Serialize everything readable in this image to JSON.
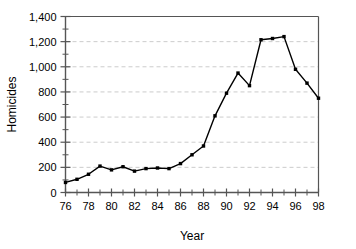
{
  "chart_data": {
    "type": "line",
    "title": "",
    "xlabel": "Year",
    "ylabel": "Homicides",
    "x": [
      76,
      77,
      78,
      79,
      80,
      81,
      82,
      83,
      84,
      85,
      86,
      87,
      88,
      89,
      90,
      91,
      92,
      93,
      94,
      95,
      96,
      97,
      98
    ],
    "values": [
      80,
      105,
      145,
      210,
      180,
      205,
      170,
      190,
      195,
      190,
      230,
      300,
      370,
      610,
      790,
      950,
      850,
      1215,
      1225,
      1240,
      980,
      870,
      750
    ],
    "x_tick_labels": [
      "76",
      "78",
      "80",
      "82",
      "84",
      "86",
      "88",
      "90",
      "92",
      "94",
      "96",
      "98"
    ],
    "x_tick_values": [
      76,
      78,
      80,
      82,
      84,
      86,
      88,
      90,
      92,
      94,
      96,
      98
    ],
    "y_tick_labels": [
      "0",
      "200",
      "400",
      "600",
      "800",
      "1,000",
      "1,200",
      "1,400"
    ],
    "y_tick_values": [
      0,
      200,
      400,
      600,
      800,
      1000,
      1200,
      1400
    ],
    "y_minor_step": 100,
    "xlim": [
      76,
      98
    ],
    "ylim": [
      0,
      1400
    ],
    "grid": true,
    "grid_axis": "y",
    "legend": "none",
    "marker": "square",
    "line_color": "#000000",
    "marker_color": "#000000",
    "grid_color": "#cccccc",
    "axis_color": "#555555",
    "background": "#ffffff"
  }
}
